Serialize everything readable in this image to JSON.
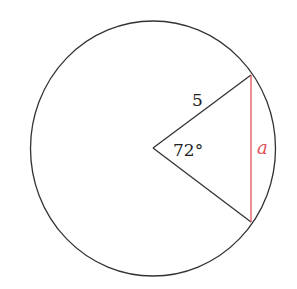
{
  "diagram": {
    "type": "circle-sector-chord",
    "center": [
      153,
      148
    ],
    "radius_px": [
      123,
      127
    ],
    "chord_endpoints": [
      [
        251,
        75
      ],
      [
        251,
        222
      ]
    ],
    "labels": {
      "radius": "5",
      "angle": "72°",
      "chord": "a"
    },
    "colors": {
      "stroke": "#333333",
      "chord": "#e0525a",
      "chord_label": "#e0525a",
      "text": "#222222"
    }
  }
}
